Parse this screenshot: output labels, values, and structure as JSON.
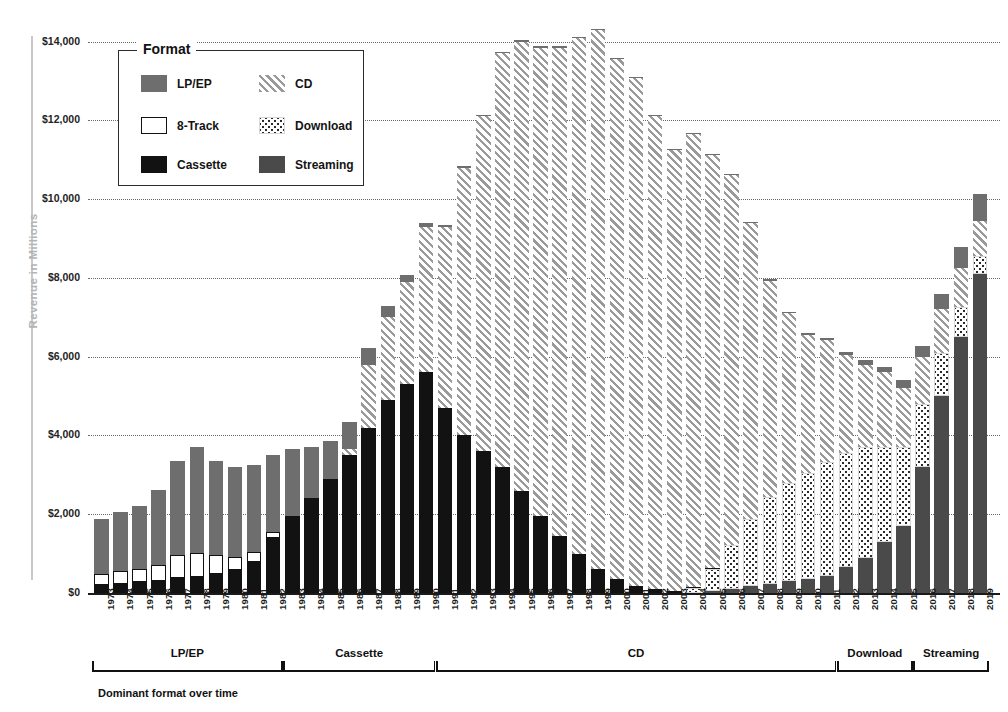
{
  "axes": {
    "ylabel": "Revenue in Millions",
    "yticks": [
      "$0",
      "$2,000",
      "$4,000",
      "$6,000",
      "$8,000",
      "$10,000",
      "$12,000",
      "$14,000"
    ],
    "ytick_values": [
      0,
      2000,
      4000,
      6000,
      8000,
      10000,
      12000,
      14000
    ]
  },
  "legend": {
    "title": "Format",
    "items": [
      {
        "label": "LP/EP",
        "key": "lpep",
        "swatch": "f-lpep"
      },
      {
        "label": "CD",
        "key": "cd",
        "swatch": "f-cd"
      },
      {
        "label": "8-Track",
        "key": "eighttrack",
        "swatch": "f-8track"
      },
      {
        "label": "Download",
        "key": "download",
        "swatch": "f-download"
      },
      {
        "label": "Cassette",
        "key": "cassette",
        "swatch": "f-cassette"
      },
      {
        "label": "Streaming",
        "key": "streaming",
        "swatch": "f-streaming"
      }
    ]
  },
  "brackets": {
    "caption": "Dominant format over time",
    "items": [
      {
        "label": "LP/EP",
        "start_year": 1973,
        "end_year": 1982
      },
      {
        "label": "Cassette",
        "start_year": 1983,
        "end_year": 1990
      },
      {
        "label": "CD",
        "start_year": 1991,
        "end_year": 2011
      },
      {
        "label": "Download",
        "start_year": 2012,
        "end_year": 2015
      },
      {
        "label": "Streaming",
        "start_year": 2016,
        "end_year": 2019
      }
    ]
  },
  "chart_data": {
    "type": "bar",
    "stacked": true,
    "title": "",
    "xlabel": "",
    "ylabel": "Revenue in Millions",
    "ylim": [
      0,
      14600
    ],
    "grid": "horizontal-dotted",
    "legend_position": "upper-left-inside",
    "stack_order_bottom_to_top": [
      "streaming",
      "download",
      "cassette",
      "cd",
      "eighttrack",
      "lpep"
    ],
    "categories": [
      "1973",
      "1974",
      "1975",
      "1976",
      "1977",
      "1978",
      "1979",
      "1980",
      "1981",
      "1982",
      "1983",
      "1984",
      "1985",
      "1986",
      "1987",
      "1988",
      "1989",
      "1990",
      "1991",
      "1992",
      "1993",
      "1994",
      "1995",
      "1996",
      "1997",
      "1998",
      "1999",
      "2000",
      "2001",
      "2002",
      "2003",
      "2004",
      "2005",
      "2006",
      "2007",
      "2008",
      "2009",
      "2010",
      "2011",
      "2012",
      "2013",
      "2014",
      "2015",
      "2016",
      "2017",
      "2018",
      "2019"
    ],
    "series": [
      {
        "name": "LP/EP",
        "key": "lpep",
        "values": [
          1400,
          1500,
          1600,
          1900,
          2400,
          2700,
          2400,
          2300,
          2200,
          1950,
          1700,
          1300,
          960,
          680,
          430,
          300,
          180,
          90,
          40,
          25,
          15,
          15,
          20,
          25,
          20,
          20,
          20,
          15,
          15,
          15,
          15,
          15,
          15,
          15,
          20,
          25,
          30,
          40,
          55,
          80,
          110,
          150,
          200,
          280,
          400,
          540,
          680
        ]
      },
      {
        "name": "8-Track",
        "key": "eighttrack",
        "values": [
          280,
          320,
          340,
          420,
          580,
          600,
          480,
          330,
          250,
          150,
          60,
          20,
          0,
          0,
          0,
          0,
          0,
          0,
          0,
          0,
          0,
          0,
          0,
          0,
          0,
          0,
          0,
          0,
          0,
          0,
          0,
          0,
          0,
          0,
          0,
          0,
          0,
          0,
          0,
          0,
          0,
          0,
          0,
          0,
          0,
          0,
          0
        ]
      },
      {
        "name": "Cassette",
        "key": "cassette",
        "values": [
          210,
          240,
          280,
          300,
          380,
          410,
          480,
          580,
          800,
          1400,
          1900,
          2400,
          2900,
          3500,
          4200,
          4900,
          5300,
          5600,
          4700,
          4000,
          3600,
          3200,
          2600,
          1950,
          1450,
          1000,
          600,
          350,
          180,
          100,
          50,
          25,
          15,
          10,
          5,
          5,
          3,
          2,
          0,
          0,
          0,
          0,
          0,
          0,
          0,
          0,
          0
        ]
      },
      {
        "name": "CD",
        "key": "cd",
        "values": [
          0,
          0,
          0,
          0,
          0,
          0,
          0,
          0,
          0,
          0,
          0,
          0,
          0,
          150,
          1600,
          2100,
          2600,
          3700,
          4600,
          6800,
          8500,
          10500,
          11400,
          11900,
          12400,
          13100,
          13700,
          13200,
          12900,
          12000,
          11200,
          11500,
          10500,
          9400,
          7500,
          5500,
          4300,
          3500,
          3100,
          2500,
          2100,
          1900,
          1500,
          1200,
          1100,
          1000,
          900
        ]
      },
      {
        "name": "Download",
        "key": "download",
        "values": [
          0,
          0,
          0,
          0,
          0,
          0,
          0,
          0,
          0,
          0,
          0,
          0,
          0,
          0,
          0,
          0,
          0,
          0,
          0,
          0,
          0,
          0,
          0,
          0,
          0,
          0,
          0,
          0,
          0,
          0,
          0,
          130,
          560,
          1100,
          1700,
          2200,
          2500,
          2700,
          2900,
          2900,
          2800,
          2400,
          2000,
          1600,
          1100,
          750,
          450
        ]
      },
      {
        "name": "Streaming",
        "key": "streaming",
        "values": [
          0,
          0,
          0,
          0,
          0,
          0,
          0,
          0,
          0,
          0,
          0,
          0,
          0,
          0,
          0,
          0,
          0,
          0,
          0,
          0,
          0,
          0,
          0,
          0,
          0,
          0,
          0,
          0,
          0,
          0,
          0,
          0,
          50,
          110,
          180,
          230,
          300,
          350,
          420,
          650,
          900,
          1300,
          1700,
          3200,
          5000,
          6500,
          8100
        ]
      }
    ]
  }
}
